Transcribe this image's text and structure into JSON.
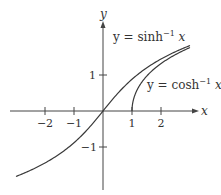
{
  "chart_data": {
    "type": "line",
    "title": "",
    "xlabel": "x",
    "ylabel": "y",
    "xlim": [
      -3,
      3.2
    ],
    "ylim": [
      -2.1,
      2.6
    ],
    "grid": false,
    "x_ticks": [
      {
        "value": -2,
        "label": "−2"
      },
      {
        "value": -1,
        "label": "−1"
      },
      {
        "value": 1,
        "label": "1"
      },
      {
        "value": 2,
        "label": "2"
      }
    ],
    "y_ticks": [
      {
        "value": 1,
        "label": "1"
      },
      {
        "value": -1,
        "label": "−1"
      }
    ],
    "series": [
      {
        "name": "y = sinh⁻¹ x",
        "function": "asinh",
        "domain": [
          -3,
          3
        ],
        "x": [
          -3,
          -2.5,
          -2,
          -1.5,
          -1,
          -0.5,
          0,
          0.5,
          1,
          1.5,
          2,
          2.5,
          3
        ],
        "y": [
          -1.818,
          -1.647,
          -1.444,
          -1.195,
          -0.881,
          -0.481,
          0,
          0.481,
          0.881,
          1.195,
          1.444,
          1.647,
          1.818
        ]
      },
      {
        "name": "y = cosh⁻¹ x",
        "function": "acosh",
        "domain": [
          1,
          3
        ],
        "x": [
          1,
          1.05,
          1.1,
          1.2,
          1.35,
          1.5,
          1.75,
          2,
          2.25,
          2.5,
          2.75,
          3
        ],
        "y": [
          0,
          0.315,
          0.444,
          0.622,
          0.806,
          0.962,
          1.159,
          1.317,
          1.45,
          1.567,
          1.669,
          1.763
        ]
      }
    ],
    "annotations": [
      {
        "text": "y = sinh⁻¹ x",
        "target": "sinh-curve"
      },
      {
        "text": "y = cosh⁻¹ x",
        "target": "cosh-curve"
      }
    ]
  },
  "labels": {
    "x_axis": "x",
    "y_axis": "y",
    "sinh_label_prefix": "y = sinh",
    "sinh_label_sup": "−1",
    "sinh_label_suffix": " x",
    "cosh_label_prefix": "y = cosh",
    "cosh_label_sup": "−1",
    "cosh_label_suffix": " x",
    "tick_x_m2": "−2",
    "tick_x_m1": "−1",
    "tick_x_1": "1",
    "tick_x_2": "2",
    "tick_y_1": "1",
    "tick_y_m1": "−1"
  },
  "colors": {
    "axis": "#444444",
    "curve": "#3a3a3a"
  }
}
